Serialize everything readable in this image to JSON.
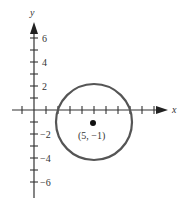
{
  "diagram": {
    "type": "coordinate-plane-circle",
    "axes": {
      "x_label": "x",
      "y_label": "y",
      "y_tick_labels": [
        {
          "value": 6,
          "text": "6"
        },
        {
          "value": 4,
          "text": "4"
        },
        {
          "value": 2,
          "text": "2"
        },
        {
          "value": -2,
          "text": "−2"
        },
        {
          "value": -4,
          "text": "−4"
        },
        {
          "value": -6,
          "text": "−6"
        }
      ],
      "x_range": [
        -2,
        11
      ],
      "y_range": [
        -7,
        7
      ]
    },
    "circle": {
      "center": [
        5,
        -1
      ],
      "radius": 4,
      "center_label": "(5, −1)"
    },
    "colors": {
      "axis": "#333333",
      "circle": "#555555",
      "point": "#111111"
    }
  }
}
